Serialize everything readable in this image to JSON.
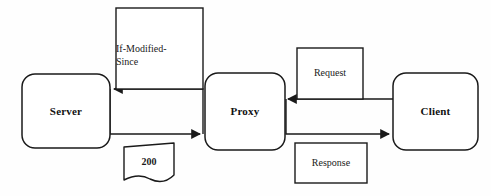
{
  "diagram": {
    "background_color": "#fefefe",
    "stroke_color": "#1a1a1a",
    "text_color": "#121212",
    "nodes": [
      {
        "id": "server",
        "label": "Server",
        "shape": "rounded-rectangle"
      },
      {
        "id": "proxy",
        "label": "Proxy",
        "shape": "rounded-rectangle"
      },
      {
        "id": "client",
        "label": "Client",
        "shape": "rounded-rectangle"
      }
    ],
    "messages": [
      {
        "id": "if-modified-since",
        "label_line1": "If-Modified-",
        "label_line2": "Since",
        "label_full": "If-Modified-Since",
        "shape": "rectangle",
        "on_edge": "proxy-to-server"
      },
      {
        "id": "status-200",
        "label": "200",
        "shape": "document",
        "on_edge": "server-to-proxy"
      },
      {
        "id": "request",
        "label": "Request",
        "shape": "rectangle",
        "on_edge": "client-to-proxy"
      },
      {
        "id": "response",
        "label": "Response",
        "shape": "rectangle",
        "on_edge": "proxy-to-client"
      }
    ],
    "edges": [
      {
        "id": "proxy-to-server",
        "from": "proxy",
        "to": "server",
        "direction": "left",
        "arrowhead": "filled"
      },
      {
        "id": "server-to-proxy",
        "from": "server",
        "to": "proxy",
        "direction": "right",
        "arrowhead": "filled"
      },
      {
        "id": "client-to-proxy",
        "from": "client",
        "to": "proxy",
        "direction": "left",
        "arrowhead": "filled"
      },
      {
        "id": "proxy-to-client",
        "from": "proxy",
        "to": "client",
        "direction": "right",
        "arrowhead": "filled"
      }
    ]
  }
}
